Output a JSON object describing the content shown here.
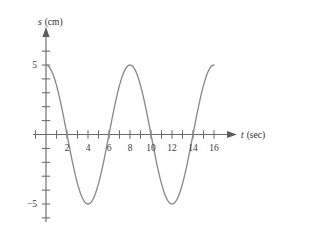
{
  "chart_data": {
    "type": "line",
    "title": "",
    "xlabel": "t (sec)",
    "ylabel": "s (cm)",
    "xlabel_variable": "t",
    "xlabel_unit": "(sec)",
    "ylabel_variable": "s",
    "ylabel_unit": "(cm)",
    "xlim": [
      -1.2,
      17.2
    ],
    "ylim": [
      -7.0,
      7.0
    ],
    "grid": false,
    "legend": null,
    "curve_color": "#8a8a8a",
    "axis_color": "#6b6b6b",
    "amplitude": 5,
    "period": 8,
    "equation": "s = 5 cos(2*pi*t/8)",
    "x_tick_values": [
      -1,
      1,
      2,
      3,
      4,
      5,
      6,
      7,
      8,
      9,
      10,
      11,
      12,
      13,
      14,
      15,
      16,
      17
    ],
    "x_tick_labels": [
      {
        "value": 2,
        "text": "2"
      },
      {
        "value": 4,
        "text": "4"
      },
      {
        "value": 6,
        "text": "6"
      },
      {
        "value": 8,
        "text": "8"
      },
      {
        "value": 10,
        "text": "10"
      },
      {
        "value": 12,
        "text": "12"
      },
      {
        "value": 14,
        "text": "14"
      },
      {
        "value": 16,
        "text": "16"
      }
    ],
    "y_tick_values": [
      -6,
      -5,
      -4,
      -3,
      -2,
      -1,
      1,
      2,
      3,
      4,
      5,
      6
    ],
    "y_tick_labels": [
      {
        "value": 5,
        "text": "5"
      },
      {
        "value": -5,
        "text": "−5"
      }
    ],
    "x": [
      0,
      0.5,
      1,
      1.5,
      2,
      2.5,
      3,
      3.5,
      4,
      4.5,
      5,
      5.5,
      6,
      6.5,
      7,
      7.5,
      8,
      8.5,
      9,
      9.5,
      10,
      10.5,
      11,
      11.5,
      12,
      12.5,
      13,
      13.5,
      14,
      14.5,
      15,
      15.5,
      16
    ],
    "y": [
      5,
      4.62,
      3.54,
      1.91,
      0,
      -1.91,
      -3.54,
      -4.62,
      -5,
      -4.62,
      -3.54,
      -1.91,
      0,
      1.91,
      3.54,
      4.62,
      5,
      4.62,
      3.54,
      1.91,
      0,
      -1.91,
      -3.54,
      -4.62,
      -5,
      -4.62,
      -3.54,
      -1.91,
      0,
      1.91,
      3.54,
      4.62,
      5
    ],
    "key_points": {
      "maxima": [
        {
          "t": 0,
          "s": 5
        },
        {
          "t": 8,
          "s": 5
        },
        {
          "t": 16,
          "s": 5
        }
      ],
      "minima": [
        {
          "t": 4,
          "s": -5
        },
        {
          "t": 12,
          "s": -5
        }
      ],
      "zeros": [
        2,
        6,
        10,
        14
      ]
    }
  },
  "labels": {
    "x_axis_title_variable": "t",
    "x_axis_title_unit": "(sec)",
    "y_axis_title_variable": "s",
    "y_axis_title_unit": "(cm)"
  }
}
